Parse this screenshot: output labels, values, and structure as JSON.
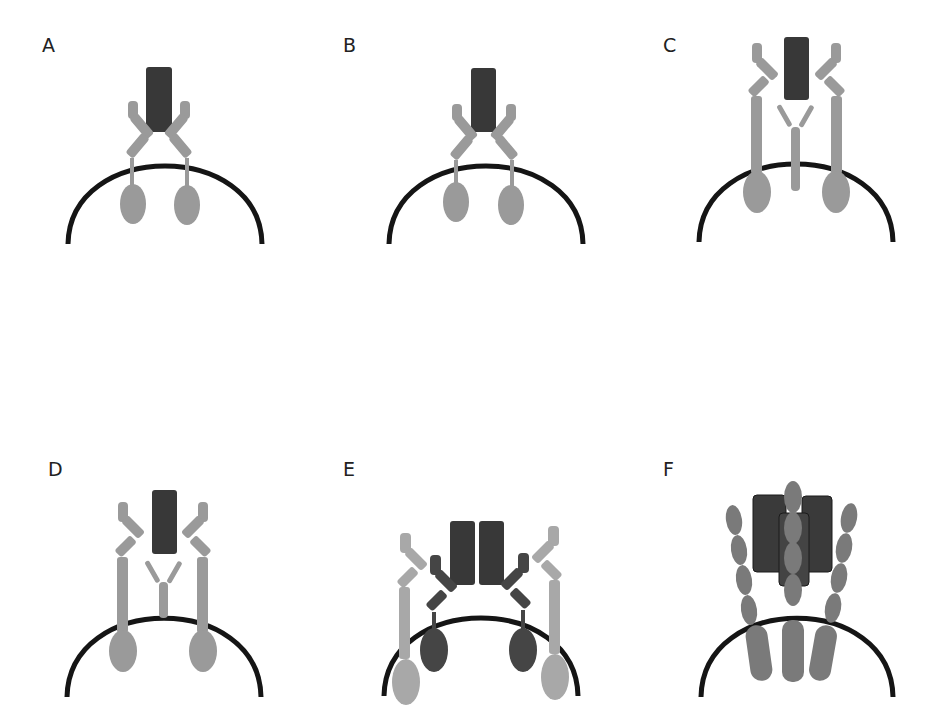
{
  "figure": {
    "panels": [
      {
        "id": "A",
        "label": "A",
        "x": 42,
        "y": 36
      },
      {
        "id": "B",
        "label": "B",
        "x": 343,
        "y": 36
      },
      {
        "id": "C",
        "label": "C",
        "x": 663,
        "y": 36
      },
      {
        "id": "D",
        "label": "D",
        "x": 48,
        "y": 460
      },
      {
        "id": "E",
        "label": "E",
        "x": 343,
        "y": 460
      },
      {
        "id": "F",
        "label": "F",
        "x": 663,
        "y": 460
      }
    ],
    "colors": {
      "membrane": "#151515",
      "ligand_dark": "#383838",
      "receptor_light": "#9a9a9a",
      "receptor_mid": "#7a7a7a",
      "receptor_dark": "#454545",
      "receptor_lighter": "#a8a8a8"
    }
  }
}
